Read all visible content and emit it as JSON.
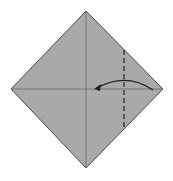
{
  "diagram": {
    "type": "origami-step",
    "paper": {
      "shape": "square-diamond",
      "fill": "#a9a9a9",
      "stroke": "#4a4a4a",
      "vertices": {
        "top": [
          86,
          11
        ],
        "right": [
          163,
          89
        ],
        "bottom": [
          86,
          168
        ],
        "left": [
          11,
          89
        ]
      }
    },
    "creases": [
      {
        "name": "vertical-crease",
        "from": [
          86,
          11
        ],
        "to": [
          86,
          168
        ],
        "style": "thin"
      },
      {
        "name": "horizontal-crease",
        "from": [
          11,
          89
        ],
        "to": [
          163,
          89
        ],
        "style": "thin"
      }
    ],
    "valley_fold_line": {
      "from": [
        124,
        50
      ],
      "to": [
        124,
        129
      ],
      "style": "dashed",
      "color": "#222222"
    },
    "fold_arrow": {
      "from": [
        153,
        90
      ],
      "to": [
        95,
        89
      ],
      "direction": "left",
      "color": "#222222"
    }
  }
}
